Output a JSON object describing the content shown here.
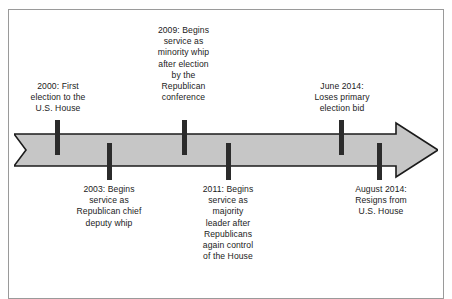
{
  "diagram": {
    "type": "horizontal-timeline-arrow",
    "direction": "left-to-right",
    "colors": {
      "arrow_fill": "#c6c6c6",
      "arrow_stroke": "#1b1b1b",
      "tick": "#2b2b2b",
      "frame": "#9a9a9a",
      "background": "#ffffff",
      "text": "#1b1b1b"
    },
    "events": [
      {
        "id": "event-2000",
        "date": "2000",
        "side": "above",
        "text": "2000: First\nelection to the\nU.S. House",
        "lines": [
          "2000: First",
          "election to the",
          "U.S. House"
        ]
      },
      {
        "id": "event-2003",
        "date": "2003",
        "side": "below",
        "text": "2003: Begins\nservice as\nRepublican chief\ndeputy whip",
        "lines": [
          "2003: Begins",
          "service as",
          "Republican chief",
          "deputy whip"
        ]
      },
      {
        "id": "event-2009",
        "date": "2009",
        "side": "above",
        "text": "2009: Begins\nservice as\nminority whip\nafter election\nby the\nRepublican\nconference",
        "lines": [
          "2009: Begins",
          "service as",
          "minority whip",
          "after election",
          "by the",
          "Republican",
          "conference"
        ]
      },
      {
        "id": "event-2011",
        "date": "2011",
        "side": "below",
        "text": "2011: Begins\nservice as\nmajority\nleader after\nRepublicans\nagain control\nof the House",
        "lines": [
          "2011: Begins",
          "service as",
          "majority",
          "leader after",
          "Republicans",
          "again control",
          "of the House"
        ]
      },
      {
        "id": "event-june-2014",
        "date": "June 2014",
        "side": "above",
        "text": "June 2014:\nLoses primary\nelection bid",
        "lines": [
          "June 2014:",
          "Loses primary",
          "election bid"
        ]
      },
      {
        "id": "event-august-2014",
        "date": "August 2014",
        "side": "below",
        "text": "August 2014:\nResigns from\nU.S. House",
        "lines": [
          "August 2014:",
          "Resigns from",
          "U.S. House"
        ]
      }
    ]
  }
}
